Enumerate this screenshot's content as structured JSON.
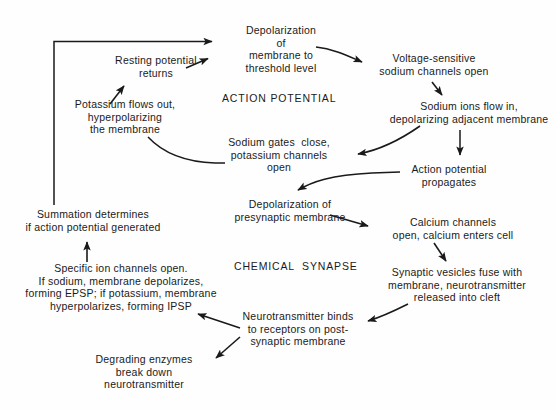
{
  "diagram": {
    "section_labels": [
      {
        "name": "action-potential-label",
        "text": "ACTION POTENTIAL",
        "x": 222,
        "y": 92,
        "w": 112
      },
      {
        "name": "chemical-synapse-label",
        "text": "CHEMICAL  SYNAPSE",
        "x": 234,
        "y": 260,
        "w": 116
      }
    ],
    "nodes": [
      {
        "id": "depolarization-threshold",
        "text": "Depolarization\nof\nmembrane to\nthreshold level",
        "x": 220,
        "y": 24,
        "w": 122
      },
      {
        "id": "voltage-sensitive-channels",
        "text": "Voltage-sensitive\nsodium channels open",
        "x": 372,
        "y": 52,
        "w": 124
      },
      {
        "id": "sodium-ions-flow-in",
        "text": "Sodium ions flow in,\ndepolarizing adjacent membrane",
        "x": 383,
        "y": 100,
        "w": 172
      },
      {
        "id": "action-potential-propagates",
        "text": "Action potential\npropagates",
        "x": 400,
        "y": 163,
        "w": 98
      },
      {
        "id": "sodium-gates-close",
        "text": "Sodium gates  close,\npotassium channels\nopen",
        "x": 219,
        "y": 136,
        "w": 120
      },
      {
        "id": "potassium-flows-out",
        "text": "Potassium flows out,\nhyperpolarizing\nthe membrane",
        "x": 60,
        "y": 98,
        "w": 130
      },
      {
        "id": "resting-potential-returns",
        "text": "Resting potential\nreturns",
        "x": 104,
        "y": 54,
        "w": 104
      },
      {
        "id": "depolarization-presynaptic",
        "text": "Depolarization of\npresynaptic membrane",
        "x": 224,
        "y": 198,
        "w": 132
      },
      {
        "id": "calcium-channels-open",
        "text": "Calcium channels\nopen, calcium enters cell",
        "x": 385,
        "y": 216,
        "w": 136
      },
      {
        "id": "synaptic-vesicles-fuse",
        "text": "Synaptic vesicles fuse with\nmembrane, neurotransmitter\nreleased into cleft",
        "x": 378,
        "y": 266,
        "w": 158
      },
      {
        "id": "neurotransmitter-binds",
        "text": "Neurotransmitter binds\nto receptors on post-\nsynaptic membrane",
        "x": 234,
        "y": 310,
        "w": 128
      },
      {
        "id": "degrading-enzymes",
        "text": "Degrading enzymes\nbreak down\nneurotransmitter",
        "x": 82,
        "y": 353,
        "w": 124
      },
      {
        "id": "specific-ion-channels",
        "text": "Specific ion channels open.\nIf sodium, membrane depolarizes,\nforming EPSP; if potassium, membrane\nhyperpolarizes, forming IPSP",
        "x": 14,
        "y": 262,
        "w": 214
      },
      {
        "id": "summation-determines",
        "text": "Summation determines\nif action potential generated",
        "x": 16,
        "y": 208,
        "w": 154
      }
    ],
    "colors": {
      "ink": "#1a1a1a",
      "background": "#fefefe"
    },
    "arrows": [
      {
        "id": "feedback-loop-to-depolarization",
        "from": "summation-determines",
        "to": "depolarization-threshold"
      },
      {
        "id": "resting-to-depolarization",
        "from": "resting-potential-returns",
        "to": "depolarization-threshold"
      },
      {
        "id": "threshold-to-voltage-sensitive",
        "from": "depolarization-threshold",
        "to": "voltage-sensitive-channels"
      },
      {
        "id": "voltage-to-sodium-ions",
        "from": "voltage-sensitive-channels",
        "to": "sodium-ions-flow-in"
      },
      {
        "id": "sodium-ions-to-gates-close",
        "from": "sodium-ions-flow-in",
        "to": "sodium-gates-close"
      },
      {
        "id": "sodium-ions-to-propagates",
        "from": "sodium-ions-flow-in",
        "to": "action-potential-propagates"
      },
      {
        "id": "gates-close-to-potassium-out",
        "from": "sodium-gates-close",
        "to": "potassium-flows-out"
      },
      {
        "id": "potassium-out-to-resting",
        "from": "potassium-flows-out",
        "to": "resting-potential-returns"
      },
      {
        "id": "propagates-to-presynaptic",
        "from": "action-potential-propagates",
        "to": "depolarization-presynaptic"
      },
      {
        "id": "presynaptic-to-calcium",
        "from": "depolarization-presynaptic",
        "to": "calcium-channels-open"
      },
      {
        "id": "calcium-to-vesicles",
        "from": "calcium-channels-open",
        "to": "synaptic-vesicles-fuse"
      },
      {
        "id": "vesicles-to-neurotransmitter-binds",
        "from": "synaptic-vesicles-fuse",
        "to": "neurotransmitter-binds"
      },
      {
        "id": "binds-to-specific-ion-channels",
        "from": "neurotransmitter-binds",
        "to": "specific-ion-channels"
      },
      {
        "id": "binds-to-degrading-enzymes",
        "from": "neurotransmitter-binds",
        "to": "degrading-enzymes"
      },
      {
        "id": "specific-ion-to-summation",
        "from": "specific-ion-channels",
        "to": "summation-determines"
      }
    ]
  }
}
